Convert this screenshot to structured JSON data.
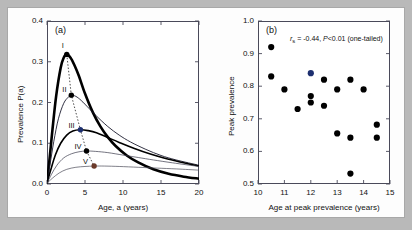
{
  "figure": {
    "background_color": "#b9b9b9",
    "canvas_color": "#fdfdfd"
  },
  "panel_a": {
    "tag": "(a)",
    "xlabel": "Age, a (years)",
    "ylabel": "Prevalence P(a)",
    "xticks": [
      "0",
      "5",
      "10",
      "15",
      "20"
    ],
    "yticks": [
      "0.0",
      "0.1",
      "0.2",
      "0.3",
      "0.4"
    ],
    "curve_labels": [
      "I",
      "II",
      "III",
      "IV",
      "V"
    ]
  },
  "panel_b": {
    "tag": "(b)",
    "xlabel": "Age at peak prevalence (years)",
    "ylabel": "Peak prevalence",
    "xticks": [
      "10",
      "11",
      "12",
      "13",
      "14",
      "15"
    ],
    "yticks": [
      "0.5",
      "0.6",
      "0.7",
      "0.8",
      "0.9",
      "1.0"
    ],
    "stat_prefix": "r",
    "stat_sub": "s",
    "stat_mid": " = -0.44, ",
    "stat_p": "P",
    "stat_suffix": "<0.01 (one-tailed)"
  },
  "chart_data": [
    {
      "type": "line",
      "title": "(a) Prevalence curves by age",
      "xlabel": "Age, a (years)",
      "ylabel": "Prevalence P(a)",
      "xlim": [
        0,
        20
      ],
      "ylim": [
        0,
        0.4
      ],
      "grid": false,
      "legend": "inline-labels",
      "series": [
        {
          "name": "I",
          "label": "I",
          "linewidth": "thick",
          "color": "#000000",
          "peak": {
            "x": 2.6,
            "y": 0.318
          },
          "marker_color": "#000000",
          "x": [
            0,
            0.3,
            0.7,
            1.2,
            1.8,
            2.2,
            2.6,
            3.1,
            3.6,
            4.2,
            5.0,
            6.0,
            7.0,
            8.0,
            9.0,
            10.5,
            12.0,
            14.0,
            16.0,
            18.0,
            20.0
          ],
          "y": [
            0.004,
            0.055,
            0.13,
            0.215,
            0.285,
            0.31,
            0.318,
            0.31,
            0.292,
            0.265,
            0.222,
            0.177,
            0.142,
            0.115,
            0.094,
            0.07,
            0.053,
            0.036,
            0.025,
            0.018,
            0.013
          ]
        },
        {
          "name": "II",
          "label": "II",
          "linewidth": "thin",
          "color": "#1b1b2e",
          "peak": {
            "x": 3.2,
            "y": 0.218
          },
          "marker_color": "#000000",
          "x": [
            0,
            0.4,
            0.9,
            1.5,
            2.2,
            2.8,
            3.2,
            3.8,
            4.5,
            5.5,
            6.5,
            8.0,
            9.5,
            11.0,
            13.0,
            15.0,
            17.0,
            20.0
          ],
          "y": [
            0.003,
            0.048,
            0.105,
            0.16,
            0.198,
            0.213,
            0.218,
            0.215,
            0.205,
            0.186,
            0.167,
            0.141,
            0.12,
            0.103,
            0.085,
            0.07,
            0.059,
            0.046
          ]
        },
        {
          "name": "III",
          "label": "III",
          "linewidth": "medium",
          "color": "#000000",
          "peak": {
            "x": 4.4,
            "y": 0.133
          },
          "marker_color": "#1d2f6f",
          "x": [
            0,
            0.5,
            1.1,
            1.8,
            2.6,
            3.4,
            4.4,
            5.4,
            6.5,
            8.0,
            9.5,
            11.5,
            13.5,
            15.5,
            17.5,
            20.0
          ],
          "y": [
            0.003,
            0.035,
            0.071,
            0.1,
            0.12,
            0.13,
            0.133,
            0.131,
            0.126,
            0.114,
            0.102,
            0.087,
            0.074,
            0.063,
            0.054,
            0.044
          ]
        },
        {
          "name": "IV",
          "label": "IV",
          "linewidth": "hairline",
          "color": "#3a3a4a",
          "peak": {
            "x": 5.2,
            "y": 0.081
          },
          "marker_color": "#000000",
          "x": [
            0,
            0.6,
            1.3,
            2.2,
            3.2,
            4.2,
            5.2,
            6.4,
            8.0,
            10.0,
            12.0,
            14.0,
            16.5,
            20.0
          ],
          "y": [
            0.002,
            0.024,
            0.046,
            0.064,
            0.074,
            0.079,
            0.081,
            0.08,
            0.077,
            0.071,
            0.065,
            0.059,
            0.052,
            0.043
          ]
        },
        {
          "name": "V",
          "label": "V",
          "linewidth": "hairline",
          "color": "#4a4a58",
          "peak": {
            "x": 6.2,
            "y": 0.044
          },
          "marker_color": "#6b3a2a",
          "x": [
            0,
            0.7,
            1.6,
            2.6,
            3.8,
            5.0,
            6.2,
            7.6,
            9.5,
            12.0,
            14.5,
            17.0,
            20.0
          ],
          "y": [
            0.002,
            0.014,
            0.027,
            0.036,
            0.041,
            0.043,
            0.044,
            0.044,
            0.043,
            0.041,
            0.039,
            0.037,
            0.034
          ]
        }
      ],
      "peak_connector": {
        "style": "dotted",
        "points": [
          [
            2.6,
            0.318
          ],
          [
            3.2,
            0.218
          ],
          [
            4.4,
            0.133
          ],
          [
            5.2,
            0.081
          ],
          [
            6.2,
            0.044
          ]
        ]
      }
    },
    {
      "type": "scatter",
      "title": "(b) Peak prevalence vs age at peak prevalence",
      "xlabel": "Age at peak prevalence (years)",
      "ylabel": "Peak prevalence",
      "xlim": [
        10,
        15
      ],
      "ylim": [
        0.5,
        1.0
      ],
      "grid": false,
      "annotation": "rs = -0.44, P<0.01 (one-tailed)",
      "spearman_rho": -0.44,
      "p_value": "<0.01",
      "tail": "one-tailed",
      "points": [
        {
          "x": 10.5,
          "y": 0.92,
          "color": "#000000"
        },
        {
          "x": 10.5,
          "y": 0.83,
          "color": "#000000"
        },
        {
          "x": 11.0,
          "y": 0.79,
          "color": "#000000"
        },
        {
          "x": 11.5,
          "y": 0.73,
          "color": "#000000"
        },
        {
          "x": 12.0,
          "y": 0.84,
          "color": "#1d2f6f"
        },
        {
          "x": 12.0,
          "y": 0.77,
          "color": "#000000"
        },
        {
          "x": 12.0,
          "y": 0.75,
          "color": "#000000"
        },
        {
          "x": 12.5,
          "y": 0.82,
          "color": "#000000"
        },
        {
          "x": 12.5,
          "y": 0.74,
          "color": "#000000"
        },
        {
          "x": 13.0,
          "y": 0.79,
          "color": "#000000"
        },
        {
          "x": 13.0,
          "y": 0.655,
          "color": "#000000"
        },
        {
          "x": 13.5,
          "y": 0.82,
          "color": "#000000"
        },
        {
          "x": 13.5,
          "y": 0.642,
          "color": "#000000"
        },
        {
          "x": 13.5,
          "y": 0.532,
          "color": "#000000"
        },
        {
          "x": 14.0,
          "y": 0.79,
          "color": "#000000"
        },
        {
          "x": 14.5,
          "y": 0.682,
          "color": "#000000"
        },
        {
          "x": 14.5,
          "y": 0.642,
          "color": "#000000"
        }
      ]
    }
  ]
}
